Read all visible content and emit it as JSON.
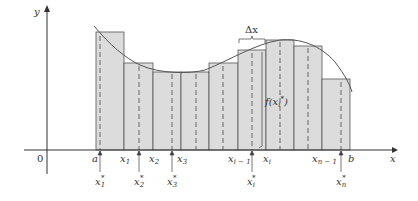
{
  "figure": {
    "type": "riemann-sum-diagram",
    "colors": {
      "bar_fill": "#dcdcdc",
      "bar_stroke": "#555555",
      "curve": "#555555",
      "axis": "#333333",
      "dash": "#666666"
    }
  },
  "axes": {
    "x_label": "x",
    "y_label": "y",
    "origin_label": "0"
  },
  "annotations": {
    "delta_x": "Δx",
    "f_label_prefix": "f(x",
    "f_label_sub": "i",
    "f_label_sup": "*",
    "f_label_suffix": ")"
  },
  "partition_labels": [
    {
      "main": "a",
      "sub": "",
      "x": 93
    },
    {
      "main": "x",
      "sub": "1",
      "x": 120
    },
    {
      "main": "x",
      "sub": "2",
      "x": 149
    },
    {
      "main": "x",
      "sub": "3",
      "x": 177
    },
    {
      "main": "x",
      "sub": "i − 1",
      "x": 255
    },
    {
      "main": "x",
      "sub": "i",
      "x": 262
    },
    {
      "main": "x",
      "sub": "n − 1",
      "x": 312
    },
    {
      "main": "b",
      "sub": "",
      "x": 348
    }
  ],
  "sample_labels": [
    {
      "main": "x",
      "sub": "1",
      "sup": "*",
      "x": 96
    },
    {
      "main": "x",
      "sub": "2",
      "sup": "*",
      "x": 134
    },
    {
      "main": "x",
      "sub": "3",
      "sup": "*",
      "x": 167
    },
    {
      "main": "x",
      "sub": "i",
      "sup": "*",
      "x": 246
    },
    {
      "main": "x",
      "sub": "n",
      "sup": "*",
      "x": 336
    }
  ]
}
